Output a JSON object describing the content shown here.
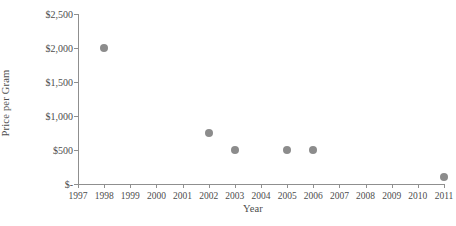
{
  "chart_data": {
    "type": "scatter",
    "title": "",
    "xlabel": "Year",
    "ylabel": "Price per Gram",
    "xlim": [
      1997,
      2011
    ],
    "ylim": [
      0,
      2500
    ],
    "grid": false,
    "legend": null,
    "marker_color": "#8c8c8c",
    "axis_color": "#8f8f8f",
    "x_tick_labels": [
      "1997",
      "1998",
      "1999",
      "2000",
      "2001",
      "2002",
      "2003",
      "2004",
      "2005",
      "2006",
      "2007",
      "2008",
      "2009",
      "2010",
      "2011"
    ],
    "x_tick_values": [
      1997,
      1998,
      1999,
      2000,
      2001,
      2002,
      2003,
      2004,
      2005,
      2006,
      2007,
      2008,
      2009,
      2010,
      2011
    ],
    "y_tick_labels": [
      "$2,500",
      "$2,000",
      "$1,500",
      "$1,000",
      "$500",
      "$-"
    ],
    "y_tick_values": [
      2500,
      2000,
      1500,
      1000,
      500,
      0
    ],
    "points": [
      {
        "x": 1998,
        "y": 2000
      },
      {
        "x": 2002,
        "y": 750
      },
      {
        "x": 2003,
        "y": 500
      },
      {
        "x": 2005,
        "y": 500
      },
      {
        "x": 2006,
        "y": 500
      },
      {
        "x": 2011,
        "y": 100
      }
    ]
  }
}
